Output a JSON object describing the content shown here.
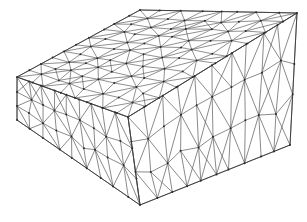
{
  "figure": {
    "render_style": "wireframe",
    "background_color": "#ffffff",
    "edge_color": "#5a5a5a",
    "silhouette_color": "#3a3a3a",
    "node_color": "#2b2b2b",
    "edge_width": 0.7,
    "node_radius": 1.0,
    "canvas": {
      "width": 307,
      "height": 222
    }
  },
  "chart_data": {
    "type": "mesh",
    "projection": "oblique / isometric-like parallel projection",
    "element_type": "triangle (surface facets of tetrahedra)",
    "visible_faces": [
      "top",
      "left",
      "right"
    ],
    "box_corners": {
      "top_left": [
        17,
        77
      ],
      "top_back": [
        140,
        10
      ],
      "top_right": [
        297,
        13
      ],
      "top_front": [
        128,
        117
      ],
      "bottom_left": [
        17,
        120
      ],
      "bottom_front": [
        140,
        205
      ],
      "bottom_right": [
        290,
        145
      ]
    },
    "grid_resolution": {
      "u": 10,
      "v": 8,
      "depth": 3
    },
    "jitter": 0.18,
    "seed": 20240517,
    "faces": [
      {
        "name": "top",
        "quad": [
          [
            17,
            77
          ],
          [
            140,
            10
          ],
          [
            297,
            13
          ],
          [
            128,
            117
          ]
        ],
        "nu": 10,
        "nv": 8,
        "jitter": 0.2
      },
      {
        "name": "left",
        "quad": [
          [
            17,
            77
          ],
          [
            128,
            117
          ],
          [
            140,
            205
          ],
          [
            17,
            120
          ]
        ],
        "nu": 9,
        "nv": 3,
        "jitter": 0.16
      },
      {
        "name": "right",
        "quad": [
          [
            128,
            117
          ],
          [
            297,
            13
          ],
          [
            290,
            145
          ],
          [
            140,
            205
          ]
        ],
        "nu": 10,
        "nv": 3,
        "jitter": 0.16
      }
    ],
    "silhouette_path": [
      [
        17,
        77
      ],
      [
        140,
        10
      ],
      [
        297,
        13
      ],
      [
        290,
        145
      ],
      [
        140,
        205
      ],
      [
        17,
        120
      ],
      [
        17,
        77
      ]
    ],
    "interior_silhouette_edges": [
      [
        [
          17,
          77
        ],
        [
          128,
          117
        ]
      ],
      [
        [
          128,
          117
        ],
        [
          297,
          13
        ]
      ],
      [
        [
          128,
          117
        ],
        [
          140,
          205
        ]
      ]
    ],
    "axis_labels": [],
    "legend": [],
    "annotations": []
  }
}
